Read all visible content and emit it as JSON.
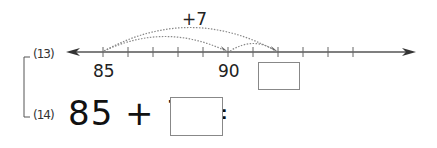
{
  "problem13": {
    "label": "(13)",
    "number_line": {
      "ticks": [
        85,
        86,
        87,
        88,
        89,
        90,
        91,
        92,
        93,
        94,
        95,
        96
      ],
      "labeled_ticks": [
        "85",
        "90"
      ],
      "jumps": [
        {
          "from": 85,
          "to": 90
        },
        {
          "from": 90,
          "to": 92
        },
        {
          "from": 85,
          "to": 92
        }
      ],
      "jump_label": "+7",
      "answer_box": ""
    }
  },
  "problem14": {
    "label": "(14)",
    "equation": "85 + 7 =",
    "answer_box": ""
  }
}
